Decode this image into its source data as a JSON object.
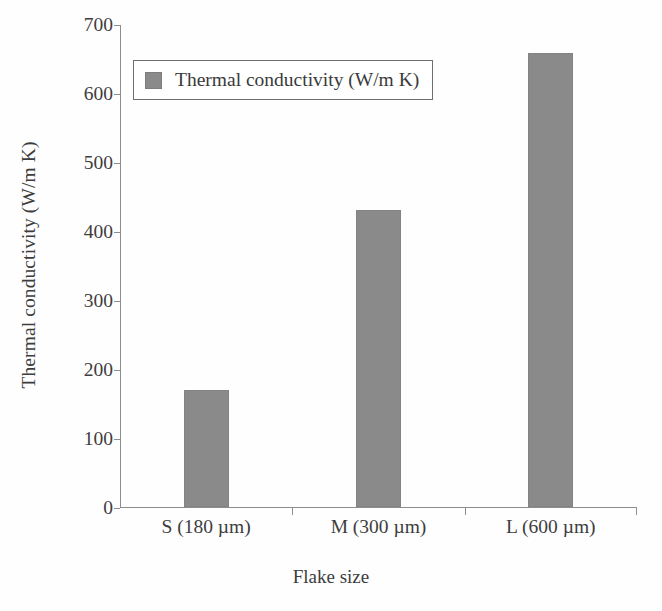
{
  "chart_data": {
    "type": "bar",
    "title": "",
    "categories": [
      "S (180 µm)",
      "M (300 µm)",
      "L (600 µm)"
    ],
    "values": [
      170,
      430,
      658
    ],
    "series": [
      {
        "name": "Thermal conductivity (W/m K)",
        "values": [
          170,
          430,
          658
        ],
        "color": "#8a8a8a"
      }
    ],
    "xlabel": "Flake size",
    "ylabel": "Thermal conductivity (W/m K)",
    "ylim": [
      0,
      700
    ],
    "yticks": [
      0,
      100,
      200,
      300,
      400,
      500,
      600,
      700
    ],
    "ytick_labels": [
      "0",
      "100",
      "200",
      "300",
      "400",
      "500",
      "600",
      "700"
    ],
    "grid": false,
    "legend": {
      "position": "upper-left-inside",
      "entries": [
        {
          "label": "Thermal conductivity (W/m K)",
          "color": "#8a8a8a"
        }
      ]
    },
    "axis_color": "#8d8d8d",
    "text_color": "#3d3d3d"
  }
}
